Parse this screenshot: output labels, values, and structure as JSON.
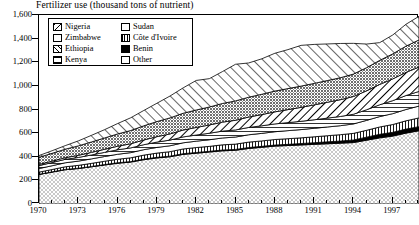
{
  "chart": {
    "title": "Fertilizer use (thousand tons of nutrient)"
  },
  "legend": {
    "left": [
      {
        "label": "Nigeria",
        "pattern": "diagonal-backslash"
      },
      {
        "label": "Zimbabwe",
        "pattern": "dark-stipple"
      },
      {
        "label": "Ethiopia",
        "pattern": "diagonal-slash"
      },
      {
        "label": "Kenya",
        "pattern": "horizontal-lines"
      }
    ],
    "right": [
      {
        "label": "Sudan",
        "pattern": "blank-white"
      },
      {
        "label": "Côte d'Ivoire",
        "pattern": "vertical-lines"
      },
      {
        "label": "Benin",
        "pattern": "solid-black"
      },
      {
        "label": "Other",
        "pattern": "light-stipple"
      }
    ]
  },
  "axes": {
    "y_ticks": [
      "0",
      "200",
      "400",
      "600",
      "800",
      "1,000",
      "1,200",
      "1,400",
      "1,600"
    ],
    "x_ticks": [
      "1970",
      "1973",
      "1976",
      "1979",
      "1982",
      "1985",
      "1988",
      "1991",
      "1994",
      "1997"
    ]
  },
  "chart_data": {
    "type": "area",
    "title": "Fertilizer use (thousand tons of nutrient)",
    "xlabel": "",
    "ylabel": "thousand tons of nutrient",
    "ylim": [
      0,
      1600
    ],
    "xlim": [
      1970,
      1999
    ],
    "grid": false,
    "stacked": true,
    "legend_position": "top-left-inset",
    "x": [
      1970,
      1971,
      1972,
      1973,
      1974,
      1975,
      1976,
      1977,
      1978,
      1979,
      1980,
      1981,
      1982,
      1983,
      1984,
      1985,
      1986,
      1987,
      1988,
      1989,
      1990,
      1991,
      1992,
      1993,
      1994,
      1995,
      1996,
      1997,
      1998,
      1999
    ],
    "stack_order_bottom_to_top": [
      "Other",
      "Benin",
      "Côte d'Ivoire",
      "Sudan",
      "Kenya",
      "Ethiopia",
      "Zimbabwe",
      "Nigeria"
    ],
    "series": [
      {
        "name": "Other",
        "values": [
          250,
          270,
          290,
          300,
          315,
          330,
          345,
          355,
          375,
          390,
          400,
          420,
          430,
          440,
          450,
          455,
          470,
          480,
          490,
          495,
          500,
          505,
          510,
          515,
          520,
          540,
          560,
          575,
          600,
          620
        ]
      },
      {
        "name": "Benin",
        "values": [
          2,
          2,
          3,
          3,
          3,
          4,
          4,
          4,
          5,
          5,
          5,
          6,
          6,
          6,
          7,
          7,
          8,
          8,
          9,
          10,
          12,
          14,
          16,
          18,
          22,
          26,
          30,
          32,
          34,
          35
        ]
      },
      {
        "name": "Côte d'Ivoire",
        "values": [
          18,
          20,
          22,
          24,
          26,
          28,
          30,
          32,
          34,
          36,
          38,
          40,
          42,
          42,
          44,
          45,
          46,
          46,
          47,
          48,
          48,
          50,
          52,
          54,
          56,
          58,
          62,
          66,
          70,
          74
        ]
      },
      {
        "name": "Sudan",
        "values": [
          30,
          32,
          34,
          36,
          38,
          40,
          42,
          44,
          46,
          48,
          50,
          52,
          54,
          56,
          58,
          60,
          62,
          64,
          66,
          68,
          70,
          72,
          74,
          76,
          80,
          84,
          88,
          92,
          96,
          100
        ]
      },
      {
        "name": "Kenya",
        "values": [
          25,
          27,
          29,
          31,
          33,
          35,
          38,
          40,
          42,
          45,
          48,
          50,
          52,
          55,
          58,
          60,
          62,
          64,
          66,
          68,
          70,
          72,
          75,
          78,
          82,
          90,
          100,
          110,
          118,
          124
        ]
      },
      {
        "name": "Ethiopia",
        "values": [
          10,
          12,
          14,
          18,
          22,
          26,
          30,
          35,
          40,
          46,
          52,
          58,
          64,
          70,
          76,
          82,
          88,
          95,
          102,
          110,
          118,
          126,
          134,
          142,
          150,
          160,
          172,
          184,
          196,
          206
        ]
      },
      {
        "name": "Zimbabwe",
        "values": [
          60,
          66,
          72,
          80,
          88,
          96,
          104,
          112,
          120,
          128,
          136,
          142,
          148,
          152,
          158,
          164,
          168,
          172,
          176,
          178,
          180,
          182,
          184,
          186,
          190,
          196,
          204,
          212,
          222,
          230
        ]
      },
      {
        "name": "Nigeria",
        "values": [
          15,
          22,
          30,
          42,
          56,
          70,
          88,
          108,
          130,
          155,
          185,
          215,
          250,
          240,
          270,
          310,
          290,
          300,
          320,
          330,
          345,
          330,
          310,
          290,
          260,
          200,
          150,
          160,
          185,
          200
        ]
      }
    ],
    "totals": [
      410,
      451,
      494,
      534,
      581,
      629,
      681,
      730,
      792,
      853,
      914,
      983,
      1046,
      1061,
      1121,
      1183,
      1194,
      1229,
      1276,
      1307,
      1343,
      1351,
      1355,
      1359,
      1360,
      1354,
      1366,
      1431,
      1521,
      1589
    ]
  }
}
